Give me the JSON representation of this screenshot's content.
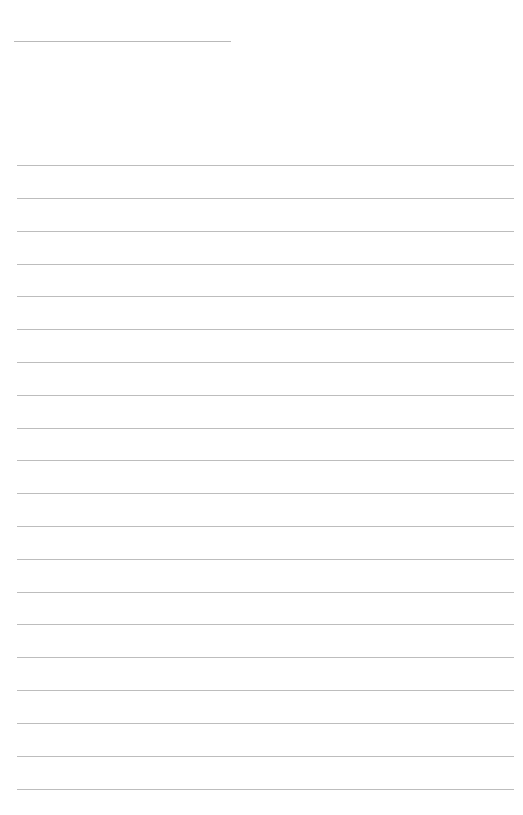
{
  "page": {
    "type": "blank lined notepaper",
    "background_color": "#ffffff",
    "line_color": "#bdbdbd",
    "header_rule": {
      "left": 14,
      "top": 41,
      "width": 217
    },
    "ruled_lines": {
      "count": 20,
      "left": 17,
      "width": 497,
      "tops": [
        165,
        198,
        231,
        264,
        296,
        329,
        362,
        395,
        428,
        460,
        493,
        526,
        559,
        592,
        624,
        657,
        690,
        723,
        756,
        789
      ]
    }
  }
}
